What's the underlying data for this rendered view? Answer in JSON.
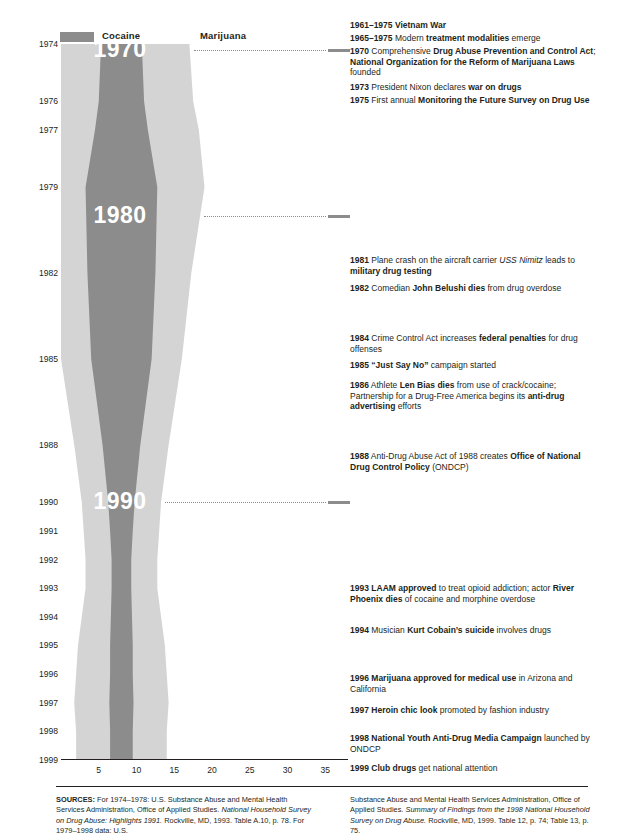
{
  "legend": {
    "items": [
      {
        "label": "Cocaine",
        "color": "#8c8c8c"
      },
      {
        "label": "Marijuana",
        "color": "#d4d4d4"
      }
    ]
  },
  "chart_data": {
    "type": "area",
    "orientation": "horizontal-mirrored-stream",
    "title": "",
    "xlabel": "",
    "ylabel": "",
    "xlim": [
      0,
      38
    ],
    "ylim": [
      1974,
      1999
    ],
    "grid": false,
    "xticks": [
      5,
      10,
      15,
      20,
      25,
      30,
      35
    ],
    "yticks": [
      1974,
      1976,
      1977,
      1979,
      1982,
      1985,
      1988,
      1990,
      1991,
      1992,
      1993,
      1994,
      1995,
      1996,
      1997,
      1998,
      1999
    ],
    "ytick_labels": [
      "1974",
      "1976",
      "1977",
      "1979",
      "1982",
      "1985",
      "1988",
      "1990",
      "1991",
      "1992",
      "1993",
      "1994",
      "1995",
      "1996",
      "1997",
      "1998",
      "1999"
    ],
    "decade_labels": [
      "1970",
      "1980",
      "1990"
    ],
    "series": [
      {
        "name": "Cocaine",
        "color": "#8c8c8c",
        "points": [
          {
            "year": 1974,
            "value": 5.4
          },
          {
            "year": 1976,
            "value": 6.0
          },
          {
            "year": 1977,
            "value": 7.0
          },
          {
            "year": 1979,
            "value": 9.5
          },
          {
            "year": 1982,
            "value": 9.0
          },
          {
            "year": 1985,
            "value": 8.0
          },
          {
            "year": 1988,
            "value": 5.0
          },
          {
            "year": 1990,
            "value": 3.5
          },
          {
            "year": 1991,
            "value": 3.0
          },
          {
            "year": 1992,
            "value": 2.6
          },
          {
            "year": 1993,
            "value": 2.6
          },
          {
            "year": 1994,
            "value": 2.8
          },
          {
            "year": 1995,
            "value": 3.0
          },
          {
            "year": 1996,
            "value": 3.0
          },
          {
            "year": 1997,
            "value": 3.2
          },
          {
            "year": 1998,
            "value": 3.0
          },
          {
            "year": 1999,
            "value": 3.0
          }
        ]
      },
      {
        "name": "Marijuana",
        "color": "#d4d4d4",
        "points": [
          {
            "year": 1974,
            "value": 18.0
          },
          {
            "year": 1976,
            "value": 19.0
          },
          {
            "year": 1977,
            "value": 20.5
          },
          {
            "year": 1979,
            "value": 22.0
          },
          {
            "year": 1982,
            "value": 18.5
          },
          {
            "year": 1985,
            "value": 16.0
          },
          {
            "year": 1988,
            "value": 12.5
          },
          {
            "year": 1990,
            "value": 10.5
          },
          {
            "year": 1991,
            "value": 10.0
          },
          {
            "year": 1992,
            "value": 9.5
          },
          {
            "year": 1993,
            "value": 9.5
          },
          {
            "year": 1994,
            "value": 10.5
          },
          {
            "year": 1995,
            "value": 11.5
          },
          {
            "year": 1996,
            "value": 12.0
          },
          {
            "year": 1997,
            "value": 12.5
          },
          {
            "year": 1998,
            "value": 12.0
          },
          {
            "year": 1999,
            "value": 12.0
          }
        ]
      }
    ]
  },
  "timeline": [
    {
      "year": "1961–1975",
      "html": "<b>Vietnam War</b>",
      "top": 0
    },
    {
      "year": "1965–1975",
      "html": "Modern <b>treatment modalities</b> emerge",
      "top": 13
    },
    {
      "year": "1970",
      "html": "Comprehensive <b>Drug Abuse Prevention and Control Act</b>; <b>National Organization for the Reform of Marijuana Laws</b> founded",
      "top": 26
    },
    {
      "year": "1973",
      "html": "President Nixon declares <b>war on drugs</b>",
      "top": 62
    },
    {
      "year": "1975",
      "html": "First annual <b>Monitoring the Future Survey on Drug Use</b>",
      "top": 75
    },
    {
      "year": "1981",
      "html": "Plane crash on the aircraft carrier <i>USS Nimitz</i> leads to <b>military drug testing</b>",
      "top": 235
    },
    {
      "year": "1982",
      "html": "Comedian <b>John Belushi dies</b> from drug overdose",
      "top": 263
    },
    {
      "year": "1984",
      "html": "Crime Control Act increases <b>federal penalties</b> for drug offenses",
      "top": 313
    },
    {
      "year": "1985",
      "html": "<b>“Just Say No”</b> campaign started",
      "top": 340
    },
    {
      "year": "1986",
      "html": "Athlete <b>Len Bias dies</b> from use of crack/cocaine; Partnership for a Drug-Free America begins its <b>anti-drug advertising</b> efforts",
      "top": 360
    },
    {
      "year": "1988",
      "html": "Anti-Drug Abuse Act of 1988 creates <b>Office of National Drug Control Policy</b> (ONDCP)",
      "top": 431
    },
    {
      "year": "1993",
      "html": "<b>LAAM approved</b> to treat opioid addiction; actor <b>River Phoenix dies</b> of cocaine and morphine overdose",
      "top": 563
    },
    {
      "year": "1994",
      "html": "Musician <b>Kurt Cobain’s suicide</b> involves drugs",
      "top": 605
    },
    {
      "year": "1996",
      "html": "<b>Marijuana approved for medical use</b> in Arizona and California",
      "top": 653
    },
    {
      "year": "1997",
      "html": "<b>Heroin chic look</b> promoted by fashion industry",
      "top": 685
    },
    {
      "year": "1998",
      "html": "<b>National Youth Anti-Drug Media Campaign</b> launched by ONDCP",
      "top": 713
    },
    {
      "year": "1999",
      "html": "<b>Club drugs</b> get national attention",
      "top": 743
    }
  ],
  "footer": {
    "left_html": "<b>SOURCES:</b> For 1974–1978: U.S. Substance Abuse and Mental Health Services Administration, Office of Applied Studies. <i>National Household Survey on Drug Abuse: Highlights 1991.</i> Rockville, MD, 1993. Table A.10, p. 78. For 1979–1998 data: U.S.",
    "right_html": "Substance Abuse and Mental Health Services Administration, Office of Applied Studies. <i>Summary of Findings from the 1998 National Household Survey on Drug Abuse.</i> Rockville, MD, 1999. Table 12, p. 74; Table 13, p. 75."
  }
}
